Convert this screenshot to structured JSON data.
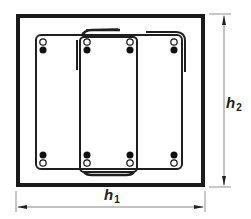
{
  "diagram": {
    "dimensions": {
      "width": {
        "symbol": "h",
        "subscript": "1"
      },
      "height": {
        "symbol": "h",
        "subscript": "2"
      }
    },
    "colors": {
      "section_outline": "#1a1a1a",
      "stirrup": "#1f1f1f",
      "dimension_line": "#555555",
      "bar_filled": "#111111",
      "bar_open": "#ffffff"
    },
    "section": {
      "x": 16,
      "y": 14,
      "width": 189,
      "height": 173
    },
    "stirrups": [
      {
        "name": "outer-stirrup",
        "x": 36,
        "y": 35,
        "width": 146,
        "height": 134
      },
      {
        "name": "inner-stirrup",
        "x": 80,
        "y": 37,
        "width": 57,
        "height": 135
      }
    ],
    "bars": {
      "columns_x": [
        43,
        87,
        130,
        174
      ],
      "top_row": {
        "open_y": 42,
        "filled_y": 50
      },
      "bottom_row": {
        "filled_y": 155,
        "open_y": 163
      }
    }
  }
}
